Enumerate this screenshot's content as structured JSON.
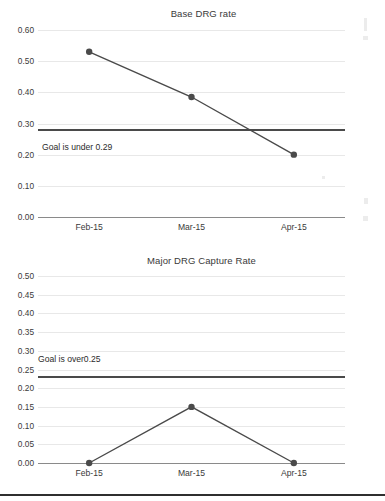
{
  "document": {
    "kind": "scanned-report-page",
    "background": "#ffffff"
  },
  "chart_data": [
    {
      "id": "base-drg-rate",
      "type": "line",
      "title": "Base DRG rate",
      "xlabel": "",
      "ylabel": "",
      "categories": [
        "Feb-15",
        "Mar-15",
        "Apr-15"
      ],
      "values": [
        0.53,
        0.385,
        0.2
      ],
      "ylim": [
        0.0,
        0.6
      ],
      "ytick_step": 0.1,
      "ytick_labels": [
        "0.00",
        "0.10",
        "0.20",
        "0.30",
        "0.40",
        "0.50",
        "0.60"
      ],
      "ytick_values": [
        0.0,
        0.1,
        0.2,
        0.3,
        0.4,
        0.5,
        0.6
      ],
      "grid": true,
      "legend": "none",
      "series_color": "#4a4a4a",
      "marker_color": "#4a4a4a",
      "grid_color": "#e8e8e8",
      "goal": {
        "value": 0.28,
        "label": "Goal is under 0.29",
        "color": "#4a4a4a",
        "label_value": 0.29
      }
    },
    {
      "id": "major-drg-capture-rate",
      "type": "line",
      "title": "Major DRG Capture Rate",
      "xlabel": "",
      "ylabel": "",
      "categories": [
        "Feb-15",
        "Mar-15",
        "Apr-15"
      ],
      "values": [
        0.0,
        0.15,
        0.0
      ],
      "ylim": [
        0.0,
        0.5
      ],
      "ytick_step": 0.05,
      "ytick_labels": [
        "0.00",
        "0.05",
        "0.10",
        "0.15",
        "0.20",
        "0.25",
        "0.30",
        "0.35",
        "0.40",
        "0.45",
        "0.50"
      ],
      "ytick_values": [
        0.0,
        0.05,
        0.1,
        0.15,
        0.2,
        0.25,
        0.3,
        0.35,
        0.4,
        0.45,
        0.5
      ],
      "grid": true,
      "legend": "none",
      "series_color": "#4a4a4a",
      "marker_color": "#4a4a4a",
      "grid_color": "#e8e8e8",
      "goal": {
        "value": 0.23,
        "label": "Goal is over0.25",
        "color": "#4a4a4a",
        "label_value": 0.25
      }
    }
  ]
}
